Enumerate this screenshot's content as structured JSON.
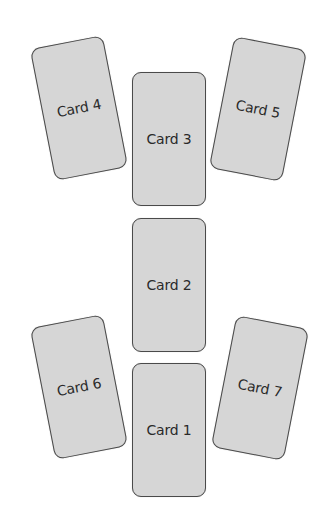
{
  "spread": {
    "cards": [
      {
        "label": "Card 1",
        "cx": 169,
        "cy": 430,
        "rotate": 0
      },
      {
        "label": "Card 2",
        "cx": 169,
        "cy": 285,
        "rotate": 0
      },
      {
        "label": "Card 3",
        "cx": 169,
        "cy": 139,
        "rotate": 0
      },
      {
        "label": "Card 4",
        "cx": 79,
        "cy": 108,
        "rotate": -11
      },
      {
        "label": "Card 5",
        "cx": 258,
        "cy": 109,
        "rotate": 11
      },
      {
        "label": "Card 6",
        "cx": 79,
        "cy": 387,
        "rotate": -11
      },
      {
        "label": "Card 7",
        "cx": 260,
        "cy": 388,
        "rotate": 11
      }
    ],
    "colors": {
      "card_fill": "#d6d6d6",
      "card_border": "#4a4a4a",
      "text": "#2a2a2a"
    }
  }
}
